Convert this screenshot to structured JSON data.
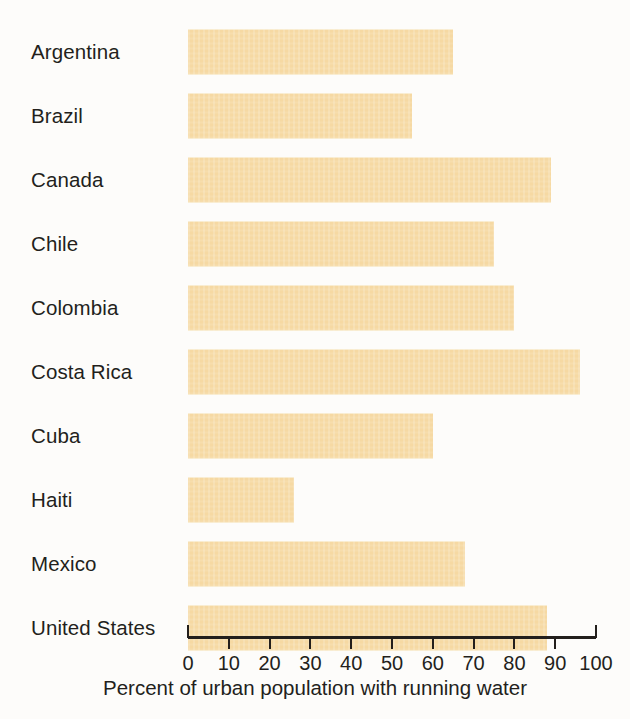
{
  "chart_data": {
    "type": "bar",
    "orientation": "horizontal",
    "title": "",
    "xlabel": "Percent of urban population with running water",
    "ylabel": "",
    "xlim": [
      0,
      100
    ],
    "grid": false,
    "legend": null,
    "bar_color": "#f6d9a3",
    "background_color": "#fdfcfa",
    "axis_color": "#231f1c",
    "tick_labels": [
      "0",
      "10",
      "20",
      "30",
      "40",
      "50",
      "60",
      "70",
      "80",
      "90",
      "100"
    ],
    "tick_values": [
      0,
      10,
      20,
      30,
      40,
      50,
      60,
      70,
      80,
      90,
      100
    ],
    "categories": [
      "Argentina",
      "Brazil",
      "Canada",
      "Chile",
      "Colombia",
      "Costa Rica",
      "Cuba",
      "Haiti",
      "Mexico",
      "United States"
    ],
    "values": [
      65,
      55,
      89,
      75,
      80,
      96,
      60,
      26,
      68,
      88
    ],
    "bars": [
      {
        "label": "Argentina",
        "value": 65
      },
      {
        "label": "Brazil",
        "value": 55
      },
      {
        "label": "Canada",
        "value": 89
      },
      {
        "label": "Chile",
        "value": 75
      },
      {
        "label": "Colombia",
        "value": 80
      },
      {
        "label": "Costa Rica",
        "value": 96
      },
      {
        "label": "Cuba",
        "value": 60
      },
      {
        "label": "Haiti",
        "value": 26
      },
      {
        "label": "Mexico",
        "value": 68
      },
      {
        "label": "United States",
        "value": 88
      }
    ]
  }
}
